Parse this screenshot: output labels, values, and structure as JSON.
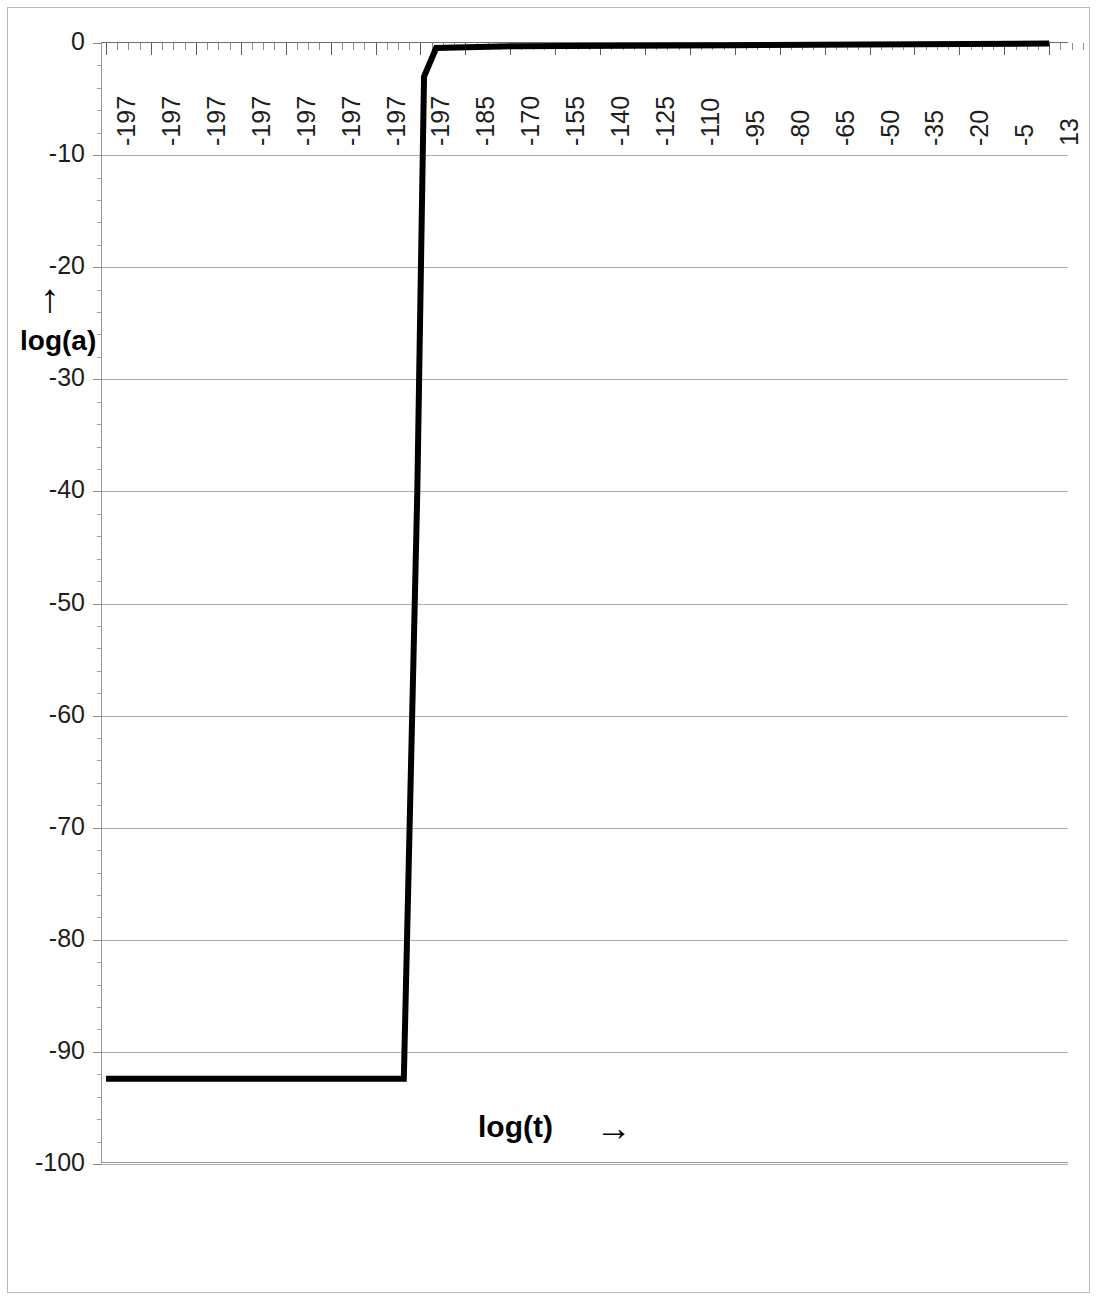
{
  "chart_data": {
    "type": "line",
    "title": "",
    "xlabel": "log(t)",
    "ylabel": "log(a)",
    "xlabel_arrow": "→",
    "ylabel_arrow": "↑",
    "grid": true,
    "legend": "none",
    "ylim": [
      -100,
      0
    ],
    "y_ticks": [
      0,
      -10,
      -20,
      -30,
      -40,
      -50,
      -60,
      -70,
      -80,
      -90,
      -100
    ],
    "y_tick_labels": [
      "0",
      "-10",
      "-20",
      "-30",
      "-40",
      "-50",
      "-60",
      "-70",
      "-80",
      "-90",
      "-100"
    ],
    "y_minor_ticks_per_interval": 5,
    "x_tick_labels": [
      "-197",
      "-197",
      "-197",
      "-197",
      "-197",
      "-197",
      "-197",
      "-197",
      "-185",
      "-170",
      "-155",
      "-140",
      "-125",
      "-110",
      "-95",
      "-80",
      "-65",
      "-50",
      "-35",
      "-20",
      "-5",
      "13"
    ],
    "x_minor_ticks_per_interval": 3,
    "x_axis_position": "top",
    "series": [
      {
        "name": "log(a) vs log(t)",
        "color": "#000000",
        "line_width": 6,
        "points": [
          {
            "x_index": 0.0,
            "y": -92.4
          },
          {
            "x_index": 6.63,
            "y": -92.4
          },
          {
            "x_index": 6.93,
            "y": -40.0
          },
          {
            "x_index": 7.08,
            "y": -3.0
          },
          {
            "x_index": 7.35,
            "y": -0.45
          },
          {
            "x_index": 9.0,
            "y": -0.3
          },
          {
            "x_index": 14.0,
            "y": -0.2
          },
          {
            "x_index": 21.0,
            "y": -0.05
          }
        ]
      }
    ]
  }
}
